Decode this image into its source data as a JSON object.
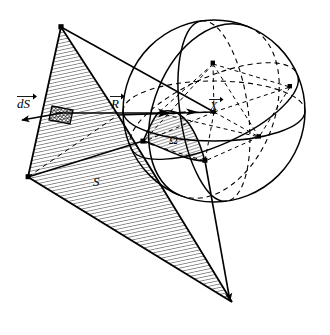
{
  "figure": {
    "background_color": "#ffffff",
    "ink_color": "#000000",
    "width": 330,
    "height": 335
  },
  "labels": {
    "surface_element_vector": "dS",
    "surface_element_vector_accent": "arrow",
    "position_vector": "R",
    "position_vector_accent": "arrow",
    "field_point_vector": "X",
    "field_point_vector_accent": "arrow",
    "surface": "S",
    "solid_angle": "Ω"
  },
  "elements": {
    "surface_patch": {
      "name": "S",
      "fill": "hatched",
      "hatch_angle_deg": 78,
      "corners": [
        [
          61,
          27
        ],
        [
          28,
          177
        ],
        [
          232,
          302
        ],
        [
          118,
          115
        ]
      ]
    },
    "surface_element": {
      "name": "dS",
      "fill": "cross-hatched",
      "center": [
        61,
        115
      ],
      "width": 22,
      "height": 16
    },
    "sphere": {
      "name": "unit sphere",
      "center": [
        214,
        111
      ],
      "radius": 91,
      "great_circles": 3,
      "hidden_line_style": "dashed"
    },
    "solid_angle_region": {
      "name": "Ω",
      "fill": "hatched",
      "description": "spherical triangle on near face of sphere"
    },
    "arrows": [
      {
        "name": "dS-normal-arrow",
        "from": [
          62,
          113
        ],
        "to": [
          13,
          122
        ],
        "head": "filled"
      },
      {
        "name": "R-arrow",
        "from": [
          62,
          114
        ],
        "to": [
          214,
          112
        ],
        "head": "filled"
      },
      {
        "name": "X-arrow",
        "from": [
          186,
          112
        ],
        "to": [
          214,
          112
        ],
        "head": "filled"
      },
      {
        "name": "cone-edge-bottom-arrow",
        "from": [
          205,
          160
        ],
        "to": [
          229,
          300
        ],
        "head": "filled"
      }
    ],
    "marked_points": [
      {
        "name": "vertex-point",
        "x": 158,
        "y": 113
      },
      {
        "name": "sphere-center",
        "x": 214,
        "y": 112
      },
      {
        "name": "node-top",
        "x": 213,
        "y": 64
      },
      {
        "name": "node-right",
        "x": 290,
        "y": 87
      },
      {
        "name": "node-lower-right",
        "x": 259,
        "y": 137
      },
      {
        "name": "node-bottom",
        "x": 205,
        "y": 161
      },
      {
        "name": "node-left",
        "x": 143,
        "y": 142
      }
    ]
  }
}
